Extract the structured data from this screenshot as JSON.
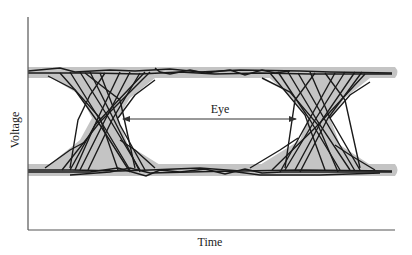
{
  "diagram": {
    "type": "eye-diagram",
    "axes": {
      "x_label": "Time",
      "y_label": "Voltage"
    },
    "annotation": {
      "label": "Eye",
      "description": "double-headed arrow spanning eye opening between crossing points"
    },
    "levels": {
      "high_rail_y": 72,
      "low_rail_y": 170
    },
    "crossings": [
      {
        "name": "left-crossing",
        "center_x": 105
      },
      {
        "name": "right-crossing",
        "center_x": 318
      }
    ],
    "colors": {
      "trace": "#1a1a1a",
      "envelope": "#c4c4c4",
      "axis": "#555555",
      "arrow": "#333333"
    }
  }
}
